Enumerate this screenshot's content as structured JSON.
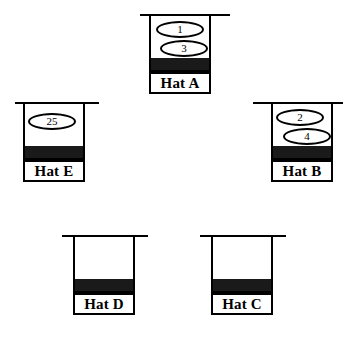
{
  "figure": {
    "type": "hats-with-tokens-diagram",
    "background_color": "#ffffff",
    "outline_color": "#000000",
    "band_color": "#1a1a1a"
  },
  "hats": [
    {
      "id": "hat-a",
      "label": "Hat A",
      "tokens": [
        "1",
        "3"
      ]
    },
    {
      "id": "hat-e",
      "label": "Hat E",
      "tokens": [
        "25"
      ]
    },
    {
      "id": "hat-b",
      "label": "Hat B",
      "tokens": [
        "2",
        "4"
      ]
    },
    {
      "id": "hat-d",
      "label": "Hat D",
      "tokens": []
    },
    {
      "id": "hat-c",
      "label": "Hat C",
      "tokens": []
    }
  ]
}
